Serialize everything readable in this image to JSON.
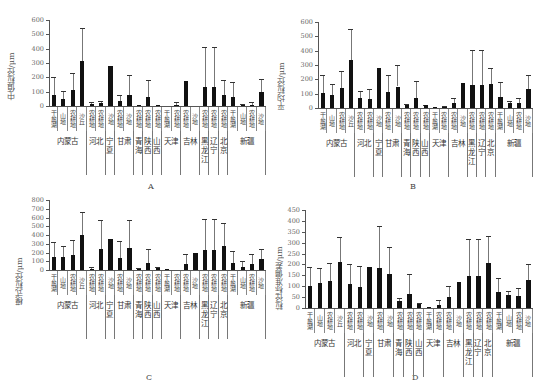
{
  "chart_data": [
    {
      "panel": "A",
      "type": "bar",
      "ylabel": "中值粒径/μm",
      "ylim": [
        0,
        600
      ],
      "yticks": [
        0,
        100,
        200,
        300,
        400,
        500,
        600
      ],
      "categories": [
        "干盐湖",
        "山地",
        "农耕地",
        "沙丘",
        "农耕地",
        "农耕地",
        "沙地",
        "农耕地",
        "沙地",
        "农耕地",
        "农耕地",
        "农耕地",
        "干盐湖",
        "农耕地",
        "农耕地",
        "沙地",
        "农耕地",
        "农耕地",
        "农耕地",
        "干盐湖",
        "山地",
        "农耕地",
        "沙地"
      ],
      "values": [
        80,
        52,
        110,
        315,
        12,
        18,
        278,
        35,
        75,
        8,
        60,
        8,
        0,
        8,
        175,
        0,
        135,
        135,
        80,
        62,
        5,
        10,
        95
      ],
      "errors_upper": [
        200,
        108,
        230,
        545,
        25,
        38,
        278,
        78,
        218,
        8,
        178,
        8,
        0,
        30,
        175,
        0,
        415,
        415,
        178,
        170,
        15,
        28,
        188
      ]
    },
    {
      "panel": "B",
      "type": "bar",
      "ylabel": "平均粒径/μm",
      "ylim": [
        0,
        600
      ],
      "yticks": [
        0,
        100,
        200,
        300,
        400,
        500,
        600
      ],
      "categories": [
        "干盐湖",
        "山地",
        "农耕地",
        "沙丘",
        "农耕地",
        "农耕地",
        "沙地",
        "农耕地",
        "沙地",
        "农耕地",
        "农耕地",
        "农耕地",
        "干盐湖",
        "农耕地",
        "农耕地",
        "沙地",
        "农耕地",
        "农耕地",
        "农耕地",
        "干盐湖",
        "山地",
        "农耕地",
        "沙地"
      ],
      "values": [
        105,
        92,
        138,
        333,
        68,
        62,
        280,
        112,
        150,
        18,
        68,
        18,
        2,
        5,
        32,
        178,
        160,
        160,
        168,
        78,
        32,
        38,
        132
      ],
      "errors_upper": [
        228,
        165,
        258,
        550,
        118,
        132,
        280,
        228,
        298,
        28,
        185,
        22,
        2,
        12,
        68,
        178,
        405,
        405,
        282,
        180,
        48,
        68,
        228
      ]
    },
    {
      "panel": "C",
      "type": "bar",
      "ylabel": "模式粒径/μm",
      "ylim": [
        0,
        800
      ],
      "yticks": [
        0,
        100,
        200,
        300,
        400,
        500,
        600,
        700,
        800
      ],
      "categories": [
        "干盐湖",
        "山地",
        "农耕地",
        "沙丘",
        "农耕地",
        "农耕地",
        "沙地",
        "农耕地",
        "沙地",
        "农耕地",
        "农耕地",
        "农耕地",
        "干盐湖",
        "农耕地",
        "农耕地",
        "沙地",
        "农耕地",
        "农耕地",
        "农耕地",
        "干盐湖",
        "山地",
        "农耕地",
        "沙地"
      ],
      "values": [
        148,
        152,
        172,
        395,
        12,
        235,
        358,
        142,
        250,
        10,
        85,
        22,
        2,
        0,
        70,
        200,
        228,
        228,
        275,
        78,
        38,
        72,
        130
      ],
      "errors_upper": [
        318,
        272,
        342,
        662,
        40,
        570,
        358,
        328,
        575,
        28,
        240,
        32,
        2,
        0,
        188,
        200,
        585,
        585,
        542,
        215,
        108,
        185,
        245
      ]
    },
    {
      "panel": "D",
      "type": "bar",
      "ylabel": "粒径标准偏差/μm",
      "ylim": [
        0,
        450
      ],
      "yticks": [
        0,
        50,
        100,
        150,
        200,
        250,
        300,
        350,
        400,
        450
      ],
      "categories": [
        "干盐湖",
        "山地",
        "农耕地",
        "沙丘",
        "农耕地",
        "农耕地",
        "沙地",
        "农耕地",
        "沙地",
        "农耕地",
        "农耕地",
        "农耕地",
        "干盐湖",
        "农耕地",
        "农耕地",
        "沙地",
        "农耕地",
        "农耕地",
        "农耕地",
        "干盐湖",
        "山地",
        "农耕地",
        "沙地"
      ],
      "values": [
        100,
        113,
        122,
        210,
        108,
        95,
        187,
        185,
        158,
        32,
        65,
        17,
        2,
        15,
        52,
        118,
        148,
        148,
        207,
        75,
        60,
        55,
        128
      ],
      "errors_upper": [
        190,
        182,
        205,
        325,
        200,
        192,
        187,
        378,
        278,
        45,
        155,
        25,
        2,
        38,
        100,
        118,
        318,
        318,
        330,
        138,
        78,
        90,
        200
      ]
    }
  ],
  "groups": [
    {
      "name": "内蒙古",
      "span": 4
    },
    {
      "name": "河北",
      "span": 2
    },
    {
      "name": "宁夏",
      "span": 1
    },
    {
      "name": "甘肃",
      "span": 2
    },
    {
      "name": "青海",
      "span": 1
    },
    {
      "name": "陕西",
      "span": 1
    },
    {
      "name": "山西",
      "span": 1
    },
    {
      "name": "天津",
      "span": 2
    },
    {
      "name": "吉林",
      "span": 2
    },
    {
      "name": "黑龙江",
      "span": 1
    },
    {
      "name": "辽宁",
      "span": 1
    },
    {
      "name": "北京",
      "span": 1
    },
    {
      "name": "新疆",
      "span": 4
    }
  ],
  "panels": {
    "A": {
      "letter": "A",
      "ylabel": "中值粒径/μm"
    },
    "B": {
      "letter": "B",
      "ylabel": "平均粒径/μm"
    },
    "C": {
      "letter": "C",
      "ylabel": "模式粒径/μm"
    },
    "D": {
      "letter": "D",
      "ylabel": "粒径标准偏差/μm"
    }
  }
}
